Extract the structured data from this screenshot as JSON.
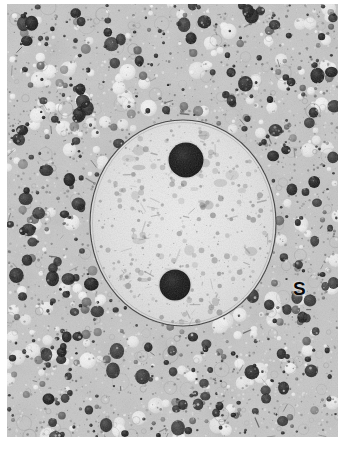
{
  "figure": {
    "kind": "transmission-electron-micrograph",
    "background_color": "#ffffff",
    "border_margin_px": {
      "left": 7,
      "top": 4,
      "right": 12,
      "bottom": 14
    }
  },
  "labels": {
    "s": "S"
  },
  "image": {
    "tone": {
      "cytoplasm_mid_gray": "#b0b0b0",
      "cytoplasm_light": "#e6e6e6",
      "cytoplasm_highlight": "#fbfbfb",
      "granule_dark": "#151515",
      "granule_medium": "#4a4a4a",
      "nucleus_fill": "#e9e9e9",
      "nucleus_light_core": "#f4f4f4",
      "nucleolus_dark": "#0c0c0c",
      "envelope_line": "#303030",
      "chromatin_speckle": "#6f6f6f"
    },
    "nucleus": {
      "center_x": 176,
      "center_y": 219,
      "radius_x": 94,
      "radius_y": 104,
      "envelope_stroke_width": 1.1
    },
    "nucleoli": [
      {
        "name": "upper-nucleolus",
        "center_x": 179,
        "center_y": 156,
        "radius": 17.5
      },
      {
        "name": "lower-nucleolus",
        "center_x": 168,
        "center_y": 281,
        "radius": 15.5
      }
    ],
    "granule_counts": {
      "dark_granules": 430,
      "light_vacuoles": 360,
      "fine_texture_specks": 2600,
      "chromatin_specks": 520
    }
  }
}
